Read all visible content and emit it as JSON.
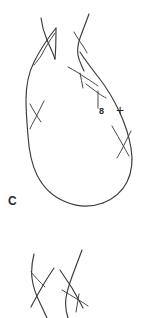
{
  "figure": {
    "background_color": "#ffffff",
    "stroke_color": "#3a3a3e",
    "width": 143,
    "height": 318
  },
  "labels": {
    "crossing_number": "8",
    "sign": "+",
    "component": "C"
  },
  "diagram_data": {
    "type": "knot-diagram",
    "description": "Hand-drawn teardrop shaped knot loop with braided strands at the top and a detached braid segment below",
    "main_loop": {
      "present": true,
      "shape": "teardrop",
      "orientation": "apex-up"
    },
    "crossings": [
      {
        "id": "x-top-left",
        "x": 45,
        "y": 45
      },
      {
        "id": "x-top-right",
        "x": 80,
        "y": 40
      },
      {
        "id": "x-mid-right",
        "x": 78,
        "y": 68
      },
      {
        "id": "x-upper-left",
        "x": 38,
        "y": 112
      },
      {
        "id": "x-right-arc-1",
        "x": 93,
        "y": 88
      },
      {
        "id": "x-right-arc-2",
        "x": 121,
        "y": 140
      }
    ],
    "lower_braid": {
      "present": true,
      "strand_count": 4,
      "crossing_count": 3,
      "region": {
        "x": 25,
        "y": 250,
        "width": 90,
        "height": 68
      }
    }
  }
}
